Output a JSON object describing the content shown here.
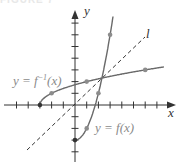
{
  "header": {
    "text": "FIGURE 7"
  },
  "labels": {
    "inverse": "y = f",
    "inverse_sup": "−1",
    "inverse_tail": "(x)",
    "function": "y = f(x)",
    "line": "l",
    "x_axis": "x",
    "y_axis": "y"
  },
  "colors": {
    "axis": "#333333",
    "curve": "#6a6a6a",
    "dots": "#8c8c8c",
    "dashed": "#333333",
    "label": "#8a8a8a"
  },
  "chart_data": {
    "type": "line",
    "title": "",
    "xlabel": "x",
    "ylabel": "y",
    "xlim": [
      -5,
      8
    ],
    "ylim": [
      -4.5,
      8
    ],
    "grid": false,
    "legend": "none",
    "annotations": [
      "y = f^{-1}(x)",
      "y = f(x)",
      "l"
    ],
    "series": [
      {
        "name": "y = f(x)",
        "formula": "x^2 - 3, x >= 0",
        "points": [
          [
            0,
            -3
          ],
          [
            1,
            -2
          ],
          [
            2,
            1
          ],
          [
            3,
            6
          ]
        ]
      },
      {
        "name": "y = f^{-1}(x)",
        "formula": "sqrt(x + 3), x >= -3",
        "points": [
          [
            -3,
            0
          ],
          [
            -2,
            1
          ],
          [
            1,
            2
          ],
          [
            6,
            3
          ]
        ]
      },
      {
        "name": "l",
        "formula": "y = x",
        "style": "dashed",
        "points": [
          [
            -4.1,
            -3.8
          ],
          [
            6,
            5.8
          ]
        ]
      }
    ]
  }
}
